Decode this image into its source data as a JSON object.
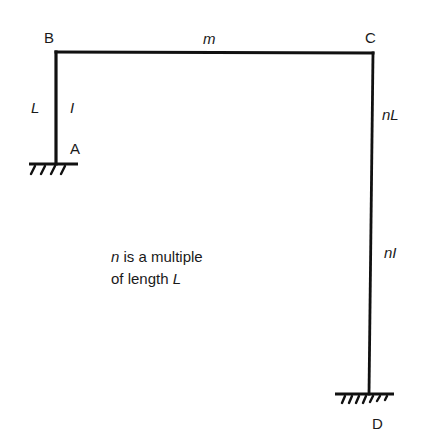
{
  "diagram": {
    "type": "portal frame",
    "nodes": {
      "A": {
        "label": "A",
        "support": "fixed"
      },
      "B": {
        "label": "B"
      },
      "C": {
        "label": "C"
      },
      "D": {
        "label": "D",
        "support": "fixed"
      }
    },
    "members": {
      "AB": {
        "length_label": "L",
        "inertia_label": "I"
      },
      "BC": {
        "label": "m"
      },
      "CD": {
        "length_label": "nL",
        "inertia_label": "nI"
      }
    },
    "note": {
      "line1_var": "n",
      "line1_rest": " is a multiple",
      "line2_text": "of length ",
      "line2_var": "L"
    },
    "colors": {
      "line": "#111111",
      "text": "#1a1a1a",
      "background": "#ffffff"
    }
  }
}
